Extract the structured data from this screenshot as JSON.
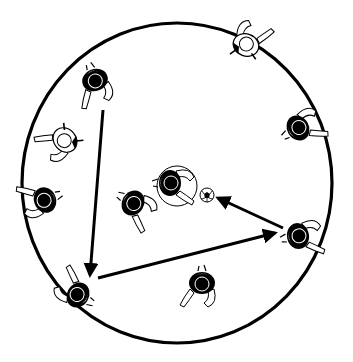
{
  "diagram": {
    "type": "soccer-drill",
    "colors": {
      "line": "#000000",
      "background": "#ffffff",
      "shirt_light": "#ffffff",
      "shirt_dark": "#000000"
    },
    "field": {
      "shape": "circle",
      "cx": 177,
      "cy": 183,
      "rx": 155,
      "ry": 160
    },
    "inner_circle": {
      "cx": 177,
      "cy": 186,
      "r": 20
    },
    "ball": {
      "x": 207,
      "y": 195,
      "r": 7,
      "icon": "soccer-ball-icon"
    },
    "players": [
      {
        "id": "p1",
        "x": 95,
        "y": 80,
        "rot": 160,
        "hair": "dark",
        "label": "player-top-left"
      },
      {
        "id": "p2",
        "x": 65,
        "y": 140,
        "rot": 230,
        "hair": "light",
        "label": "player-left-upper"
      },
      {
        "id": "p3",
        "x": 45,
        "y": 200,
        "rot": 250,
        "hair": "dark",
        "label": "player-left"
      },
      {
        "id": "p4",
        "x": 78,
        "y": 295,
        "rot": 300,
        "hair": "dark",
        "label": "player-bottom-left"
      },
      {
        "id": "p5",
        "x": 133,
        "y": 203,
        "rot": 120,
        "hair": "dark",
        "label": "player-center-left"
      },
      {
        "id": "p6",
        "x": 170,
        "y": 183,
        "rot": 90,
        "hair": "dark",
        "label": "player-center"
      },
      {
        "id": "p7",
        "x": 246,
        "y": 45,
        "rot": 20,
        "hair": "light",
        "label": "player-top-right"
      },
      {
        "id": "p8",
        "x": 298,
        "y": 128,
        "rot": 60,
        "hair": "dark",
        "label": "player-right-upper"
      },
      {
        "id": "p9",
        "x": 298,
        "y": 236,
        "rot": 80,
        "hair": "dark",
        "label": "player-right"
      },
      {
        "id": "p10",
        "x": 202,
        "y": 283,
        "rot": 180,
        "hair": "dark",
        "label": "player-bottom"
      }
    ],
    "arrows": [
      {
        "from": [
          103,
          110
        ],
        "to": [
          90,
          275
        ],
        "label": "pass-1"
      },
      {
        "from": [
          98,
          278
        ],
        "to": [
          275,
          233
        ],
        "label": "pass-2"
      },
      {
        "from": [
          283,
          228
        ],
        "to": [
          218,
          198
        ],
        "label": "pass-3"
      }
    ]
  }
}
